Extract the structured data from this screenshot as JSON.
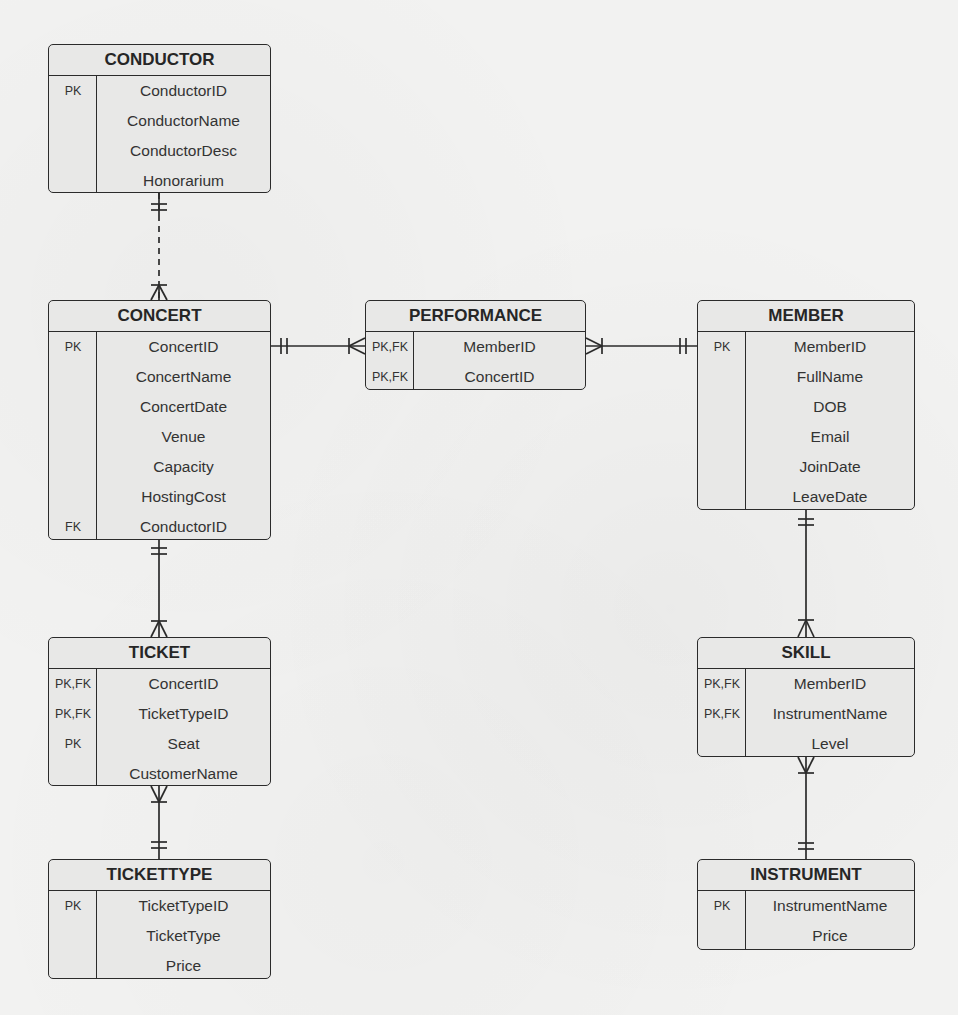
{
  "diagram": {
    "type": "entity-relationship",
    "notation": "crows-foot"
  },
  "entities": {
    "conductor": {
      "title": "CONDUCTOR",
      "rows": [
        {
          "key": "PK",
          "attr": "ConductorID"
        },
        {
          "key": "",
          "attr": "ConductorName"
        },
        {
          "key": "",
          "attr": "ConductorDesc"
        },
        {
          "key": "",
          "attr": "Honorarium"
        }
      ]
    },
    "concert": {
      "title": "CONCERT",
      "rows": [
        {
          "key": "PK",
          "attr": "ConcertID"
        },
        {
          "key": "",
          "attr": "ConcertName"
        },
        {
          "key": "",
          "attr": "ConcertDate"
        },
        {
          "key": "",
          "attr": "Venue"
        },
        {
          "key": "",
          "attr": "Capacity"
        },
        {
          "key": "",
          "attr": "HostingCost"
        },
        {
          "key": "FK",
          "attr": "ConductorID"
        }
      ]
    },
    "performance": {
      "title": "PERFORMANCE",
      "rows": [
        {
          "key": "PK,FK",
          "attr": "MemberID"
        },
        {
          "key": "PK,FK",
          "attr": "ConcertID"
        }
      ]
    },
    "member": {
      "title": "MEMBER",
      "rows": [
        {
          "key": "PK",
          "attr": "MemberID"
        },
        {
          "key": "",
          "attr": "FullName"
        },
        {
          "key": "",
          "attr": "DOB"
        },
        {
          "key": "",
          "attr": "Email"
        },
        {
          "key": "",
          "attr": "JoinDate"
        },
        {
          "key": "",
          "attr": "LeaveDate"
        }
      ]
    },
    "ticket": {
      "title": "TICKET",
      "rows": [
        {
          "key": "PK,FK",
          "attr": "ConcertID"
        },
        {
          "key": "PK,FK",
          "attr": "TicketTypeID"
        },
        {
          "key": "PK",
          "attr": "Seat"
        },
        {
          "key": "",
          "attr": "CustomerName"
        }
      ]
    },
    "tickettype": {
      "title": "TICKETTYPE",
      "rows": [
        {
          "key": "PK",
          "attr": "TicketTypeID"
        },
        {
          "key": "",
          "attr": "TicketType"
        },
        {
          "key": "",
          "attr": "Price"
        }
      ]
    },
    "skill": {
      "title": "SKILL",
      "rows": [
        {
          "key": "PK,FK",
          "attr": "MemberID"
        },
        {
          "key": "PK,FK",
          "attr": "InstrumentName"
        },
        {
          "key": "",
          "attr": "Level"
        }
      ]
    },
    "instrument": {
      "title": "INSTRUMENT",
      "rows": [
        {
          "key": "PK",
          "attr": "InstrumentName"
        },
        {
          "key": "",
          "attr": "Price"
        }
      ]
    }
  },
  "relationships": [
    {
      "from": "CONDUCTOR",
      "to": "CONCERT",
      "from_cardinality": "one-and-only-one",
      "to_cardinality": "one-or-many",
      "line": "dashed"
    },
    {
      "from": "CONCERT",
      "to": "PERFORMANCE",
      "from_cardinality": "one-and-only-one",
      "to_cardinality": "one-or-many",
      "line": "solid"
    },
    {
      "from": "MEMBER",
      "to": "PERFORMANCE",
      "from_cardinality": "one-and-only-one",
      "to_cardinality": "one-or-many",
      "line": "solid"
    },
    {
      "from": "CONCERT",
      "to": "TICKET",
      "from_cardinality": "one-and-only-one",
      "to_cardinality": "one-or-many",
      "line": "solid"
    },
    {
      "from": "TICKETTYPE",
      "to": "TICKET",
      "from_cardinality": "one-and-only-one",
      "to_cardinality": "one-or-many",
      "line": "solid"
    },
    {
      "from": "MEMBER",
      "to": "SKILL",
      "from_cardinality": "one-and-only-one",
      "to_cardinality": "one-or-many",
      "line": "solid"
    },
    {
      "from": "INSTRUMENT",
      "to": "SKILL",
      "from_cardinality": "one-and-only-one",
      "to_cardinality": "one-or-many",
      "line": "solid"
    }
  ],
  "colors": {
    "background": "#f2f2f1",
    "entity_fill": "#e8e8e7",
    "stroke": "#2b2b2b",
    "text": "#333333"
  }
}
